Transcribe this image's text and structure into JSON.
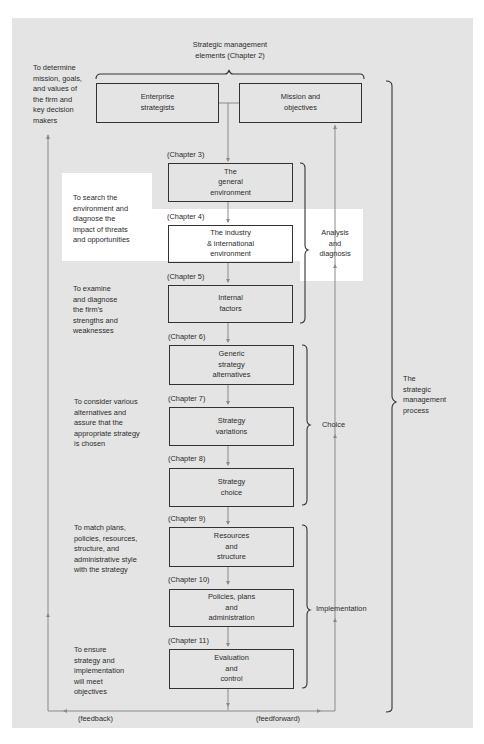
{
  "header": {
    "title": "Strategic management\nelements (Chapter 2)"
  },
  "top_boxes": [
    {
      "label": "Enterprise\nstrategists"
    },
    {
      "label": "Mission and\nobjectives"
    }
  ],
  "left_notes": [
    "To determine\nmission, goals,\nand values of\nthe firm and\nkey decision\nmakers",
    "To search the\nenvironment and\ndiagnose the\nimpact of threats\nand opportunities",
    "To examine\nand diagnose\nthe firm's\nstrengths and\nweaknesses",
    "To consider various\nalternatives and\nassure that the\nappropriate strategy\nis chosen",
    "To match plans,\npolicies, resources,\nstructure, and\nadministrative style\nwith the strategy",
    "To ensure\nstrategy and\nimplementation\nwill meet\nobjectives"
  ],
  "steps": [
    {
      "chapter": "(Chapter 3)",
      "label": "The\ngeneral\nenvironment"
    },
    {
      "chapter": "(Chapter 4)",
      "label": "The industry\n& international\nenvironment"
    },
    {
      "chapter": "(Chapter 5)",
      "label": "Internal\nfactors"
    },
    {
      "chapter": "(Chapter 6)",
      "label": "Generic\nstrategy\nalternatives"
    },
    {
      "chapter": "(Chapter 7)",
      "label": "Strategy\nvariations"
    },
    {
      "chapter": "(Chapter 8)",
      "label": "Strategy\nchoice"
    },
    {
      "chapter": "(Chapter 9)",
      "label": "Resources\nand\nstructure"
    },
    {
      "chapter": "(Chapter 10)",
      "label": "Policies, plans\nand\nadministration"
    },
    {
      "chapter": "(Chapter 11)",
      "label": "Evaluation\nand\ncontrol"
    }
  ],
  "phases": [
    {
      "label": "Analysis\nand\ndiagnosis"
    },
    {
      "label": "Choice"
    },
    {
      "label": "Implementation"
    }
  ],
  "process_label": "The\nstrategic\nmanagement\nprocess",
  "bottom": {
    "feedback": "(feedback)",
    "feedforward": "(feedforward)"
  },
  "colors": {
    "panel_bg": "#e4e4e4",
    "highlight_bg": "#ffffff",
    "line": "#333333",
    "arrow_line": "#8a8a8a"
  }
}
